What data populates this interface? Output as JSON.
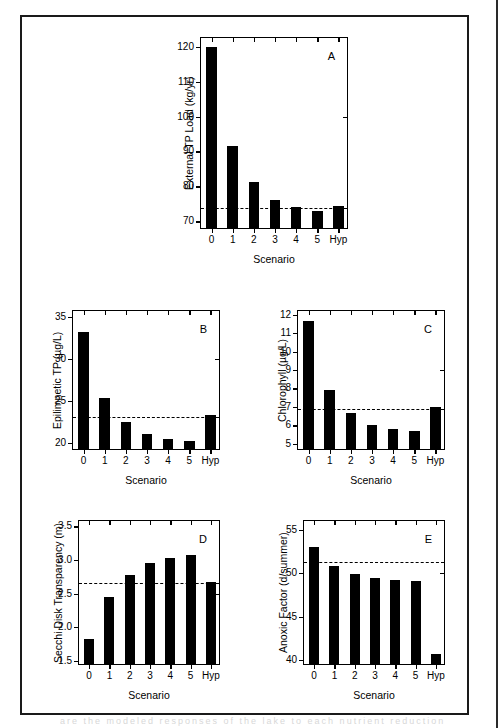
{
  "figure": {
    "background": "#ffffff",
    "ink": "#000000",
    "caption_ghost": "are the modeled responses of the lake to each nutrient reduction"
  },
  "chart_data": [
    {
      "type": "bar",
      "panel": "A",
      "title": "",
      "xlabel": "Scenario",
      "ylabel": "External TP Load (kg/yr)",
      "categories": [
        "0",
        "1",
        "2",
        "3",
        "4",
        "5",
        "Hyp"
      ],
      "values": [
        119.3,
        91.0,
        80.7,
        75.5,
        73.6,
        72.5,
        73.8
      ],
      "ylim": [
        67.5,
        122.5
      ],
      "yticks": [
        70,
        80,
        90,
        100,
        110,
        120
      ],
      "reference_line": 73.7,
      "grid": false,
      "legend": "none"
    },
    {
      "type": "bar",
      "panel": "B",
      "title": "",
      "xlabel": "Scenario",
      "ylabel": "Epilimnetic TP (µg/L)",
      "categories": [
        "0",
        "1",
        "2",
        "3",
        "4",
        "5",
        "Hyp"
      ],
      "values": [
        33.0,
        25.1,
        22.2,
        20.8,
        20.2,
        20.0,
        23.0
      ],
      "ylim": [
        19.0,
        35.7
      ],
      "yticks": [
        20,
        25,
        30,
        35
      ],
      "reference_line": 23.0,
      "grid": false,
      "legend": "none"
    },
    {
      "type": "bar",
      "panel": "C",
      "title": "",
      "xlabel": "Scenario",
      "ylabel": "Chlorophyll (µg/L)",
      "categories": [
        "0",
        "1",
        "2",
        "3",
        "4",
        "5",
        "Hyp"
      ],
      "values": [
        11.55,
        7.78,
        6.55,
        5.93,
        5.68,
        5.57,
        6.87
      ],
      "ylim": [
        4.6,
        12.2
      ],
      "yticks": [
        5,
        6,
        7,
        8,
        9,
        10,
        11,
        12
      ],
      "reference_line": 6.9,
      "grid": false,
      "legend": "none"
    },
    {
      "type": "bar",
      "panel": "D",
      "title": "",
      "xlabel": "Scenario",
      "ylabel": "Secchi Disk Transparency (m)",
      "categories": [
        "0",
        "1",
        "2",
        "3",
        "4",
        "5",
        "Hyp"
      ],
      "values": [
        1.8,
        2.42,
        2.74,
        2.92,
        3.0,
        3.04,
        2.64
      ],
      "ylim": [
        1.42,
        3.58
      ],
      "yticks": [
        1.5,
        2.0,
        2.5,
        3.0,
        3.5
      ],
      "ytick_labels": [
        "1.5",
        "2.0",
        "2.5",
        "3.0",
        "3.5"
      ],
      "reference_line": 2.65,
      "grid": false,
      "legend": "none"
    },
    {
      "type": "bar",
      "panel": "E",
      "title": "",
      "xlabel": "Scenario",
      "ylabel": "Anoxic Factor (d/summer)",
      "categories": [
        "0",
        "1",
        "2",
        "3",
        "4",
        "5",
        "Hyp"
      ],
      "values": [
        52.8,
        50.6,
        49.7,
        49.2,
        49.0,
        48.9,
        40.4
      ],
      "ylim": [
        39.3,
        56.0
      ],
      "yticks": [
        40,
        45,
        50,
        55
      ],
      "reference_line": 51.3,
      "grid": false,
      "legend": "none"
    }
  ]
}
